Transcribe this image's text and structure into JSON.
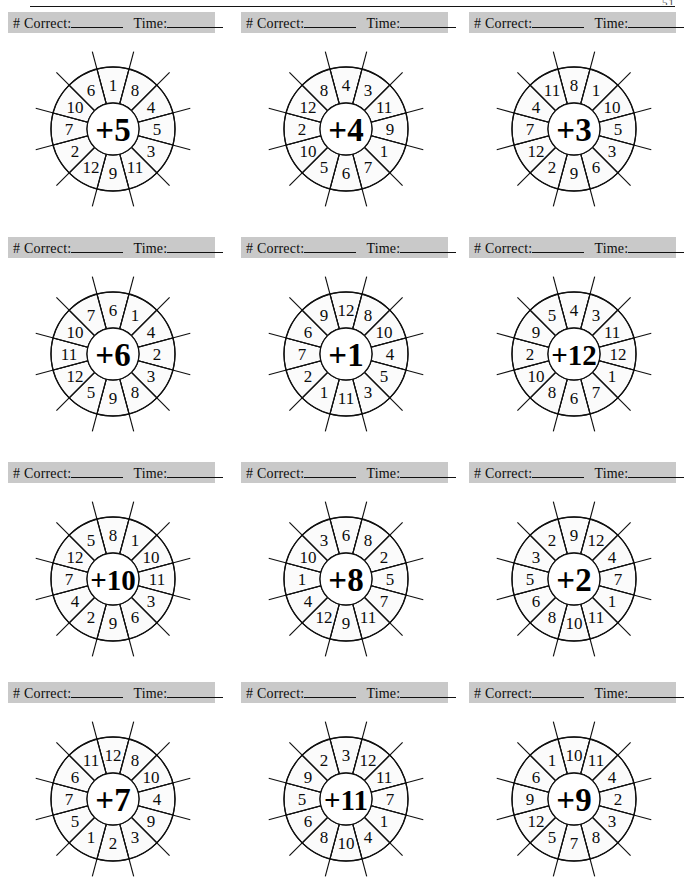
{
  "page": {
    "page_number": "51",
    "score_bar": {
      "correct_label": "# Correct:",
      "time_label": "Time:"
    }
  },
  "wheel_geometry": {
    "outer_radius": 62,
    "inner_radius": 26,
    "spoke_outer_radius": 80,
    "label_radius": 44,
    "spoke_count": 12
  },
  "problems": [
    {
      "id": "wheel-plus-5",
      "operator": "+5",
      "ring_numbers_clockwise_from_top": [
        1,
        8,
        4,
        5,
        3,
        11,
        9,
        12,
        2,
        7,
        10,
        6
      ]
    },
    {
      "id": "wheel-plus-4",
      "operator": "+4",
      "ring_numbers_clockwise_from_top": [
        4,
        3,
        11,
        9,
        1,
        7,
        6,
        5,
        10,
        2,
        12,
        8
      ]
    },
    {
      "id": "wheel-plus-3",
      "operator": "+3",
      "ring_numbers_clockwise_from_top": [
        8,
        1,
        10,
        5,
        3,
        6,
        9,
        2,
        12,
        7,
        4,
        11
      ]
    },
    {
      "id": "wheel-plus-6",
      "operator": "+6",
      "ring_numbers_clockwise_from_top": [
        6,
        1,
        4,
        2,
        3,
        8,
        9,
        5,
        12,
        11,
        10,
        7
      ]
    },
    {
      "id": "wheel-plus-1",
      "operator": "+1",
      "ring_numbers_clockwise_from_top": [
        12,
        8,
        10,
        4,
        5,
        3,
        11,
        1,
        2,
        7,
        6,
        9
      ]
    },
    {
      "id": "wheel-plus-12",
      "operator": "+12",
      "ring_numbers_clockwise_from_top": [
        4,
        3,
        11,
        12,
        1,
        7,
        6,
        8,
        10,
        2,
        9,
        5
      ]
    },
    {
      "id": "wheel-plus-10",
      "operator": "+10",
      "ring_numbers_clockwise_from_top": [
        8,
        1,
        10,
        11,
        3,
        6,
        9,
        2,
        4,
        7,
        12,
        5
      ]
    },
    {
      "id": "wheel-plus-8",
      "operator": "+8",
      "ring_numbers_clockwise_from_top": [
        6,
        8,
        2,
        5,
        7,
        11,
        9,
        12,
        4,
        1,
        10,
        3
      ]
    },
    {
      "id": "wheel-plus-2",
      "operator": "+2",
      "ring_numbers_clockwise_from_top": [
        9,
        12,
        4,
        7,
        1,
        11,
        10,
        8,
        6,
        5,
        3,
        2
      ]
    },
    {
      "id": "wheel-plus-7",
      "operator": "+7",
      "ring_numbers_clockwise_from_top": [
        12,
        8,
        10,
        4,
        9,
        3,
        2,
        1,
        5,
        7,
        6,
        11
      ]
    },
    {
      "id": "wheel-plus-11",
      "operator": "+11",
      "ring_numbers_clockwise_from_top": [
        3,
        12,
        11,
        7,
        1,
        4,
        10,
        8,
        6,
        5,
        9,
        2
      ]
    },
    {
      "id": "wheel-plus-9",
      "operator": "+9",
      "ring_numbers_clockwise_from_top": [
        10,
        11,
        4,
        2,
        3,
        8,
        7,
        5,
        12,
        9,
        6,
        1
      ]
    }
  ],
  "colors": {
    "bar_background": "#c9c9c9",
    "ink": "#101010",
    "wedge_fill": "#fbfbfb"
  }
}
